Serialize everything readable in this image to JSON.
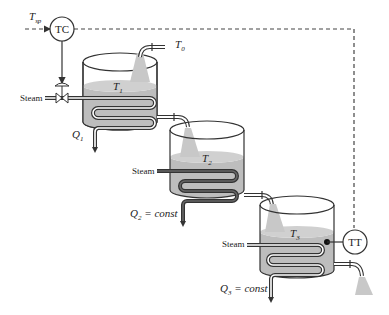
{
  "diagram": {
    "type": "stirred-tank-heater-cascade",
    "controller": {
      "label": "TC",
      "setpoint_label": "T",
      "setpoint_sub": "sp"
    },
    "transmitter": {
      "label": "TT"
    },
    "inlet": {
      "label": "T",
      "sub": "0"
    },
    "tanks": [
      {
        "temp_label": "T",
        "temp_sub": "1",
        "steam_label": "Steam",
        "q_label": "Q",
        "q_sub": "1",
        "q_suffix": ""
      },
      {
        "temp_label": "T",
        "temp_sub": "2",
        "steam_label": "Steam",
        "q_label": "Q",
        "q_sub": "2",
        "q_suffix": " = const"
      },
      {
        "temp_label": "T",
        "temp_sub": "3",
        "steam_label": "Steam",
        "q_label": "Q",
        "q_sub": "3",
        "q_suffix": " = const"
      }
    ],
    "colors": {
      "liquid": "#bdbdbd",
      "line": "#333333",
      "spray": "#c8c8c8"
    }
  }
}
